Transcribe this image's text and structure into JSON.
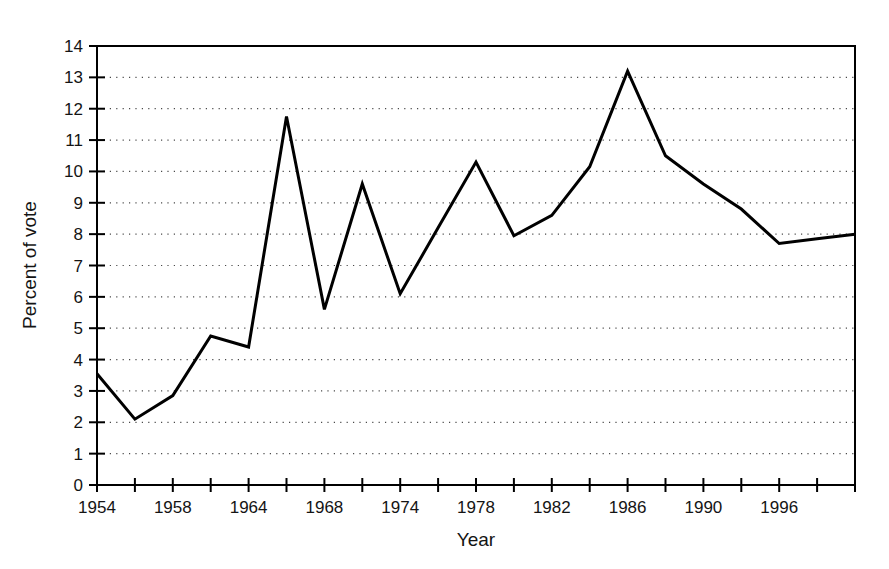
{
  "chart_data": {
    "type": "line",
    "title": "",
    "xlabel": "Year",
    "ylabel": "Percent of vote",
    "xlim": [
      0,
      20
    ],
    "ylim": [
      0,
      14
    ],
    "grid": true,
    "grid_style": "dotted-horizontal",
    "legend": "none",
    "line_color": "#000000",
    "line_width": 3,
    "x_tick_count": 21,
    "x_tick_labels": [
      "1954",
      "",
      "1958",
      "",
      "1964",
      "",
      "1968",
      "",
      "1974",
      "",
      "1978",
      "",
      "1982",
      "",
      "1986",
      "",
      "1990",
      "",
      "1996",
      "",
      ""
    ],
    "x_labeled_ticks": [
      {
        "index": 0,
        "label": "1954"
      },
      {
        "index": 2,
        "label": "1958"
      },
      {
        "index": 4,
        "label": "1964"
      },
      {
        "index": 6,
        "label": "1968"
      },
      {
        "index": 8,
        "label": "1974"
      },
      {
        "index": 10,
        "label": "1978"
      },
      {
        "index": 12,
        "label": "1982"
      },
      {
        "index": 14,
        "label": "1986"
      },
      {
        "index": 16,
        "label": "1990"
      },
      {
        "index": 18,
        "label": "1996"
      }
    ],
    "y_tick_labels": [
      "0",
      "1",
      "2",
      "3",
      "4",
      "5",
      "6",
      "7",
      "8",
      "9",
      "10",
      "11",
      "12",
      "13",
      "14"
    ],
    "y_ticks": [
      0,
      1,
      2,
      3,
      4,
      5,
      6,
      7,
      8,
      9,
      10,
      11,
      12,
      13,
      14
    ],
    "categories": [
      "1954",
      "1956",
      "1958",
      "1961",
      "1964",
      "1966",
      "1968",
      "1971",
      "1974",
      "1976",
      "1978",
      "1980",
      "1982",
      "1984",
      "1986",
      "1988",
      "1990",
      "1993",
      "1996",
      "1998",
      "2000"
    ],
    "x": [
      0,
      1,
      2,
      3,
      4,
      5,
      6,
      7,
      8,
      9,
      10,
      11,
      12,
      13,
      14,
      15,
      16,
      17,
      18,
      19,
      20
    ],
    "values": [
      3.55,
      2.1,
      2.85,
      4.75,
      4.4,
      11.75,
      5.6,
      9.6,
      6.1,
      8.2,
      10.3,
      7.95,
      8.6,
      10.15,
      13.2,
      10.5,
      9.6,
      8.8,
      7.7,
      7.85,
      8.0
    ],
    "series": [
      {
        "name": "Percent of vote",
        "values": [
          3.55,
          2.1,
          2.85,
          4.75,
          4.4,
          11.75,
          5.6,
          9.6,
          6.1,
          8.2,
          10.3,
          7.95,
          8.6,
          10.15,
          13.2,
          10.5,
          9.6,
          8.8,
          7.7,
          7.85,
          8.0
        ]
      }
    ]
  },
  "axes": {
    "x_title": "Year",
    "y_title": "Percent of vote"
  }
}
